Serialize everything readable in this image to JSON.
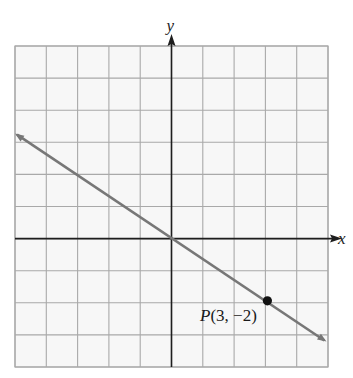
{
  "chart_data": {
    "type": "line",
    "title": "",
    "xlabel": "x",
    "ylabel": "y",
    "xlim": [
      -5,
      5
    ],
    "ylim": [
      -4,
      6
    ],
    "grid": true,
    "grid_step": 1,
    "legend": null,
    "series": [
      {
        "name": "line through origin and P",
        "equation": "y = -2/3 x",
        "slope": -0.6667,
        "intercept": 0,
        "x": [
          -5,
          0,
          3,
          5
        ],
        "y": [
          3.33,
          0,
          -2,
          -3.33
        ],
        "arrows": "both"
      }
    ],
    "points": [
      {
        "name": "P",
        "x": 3,
        "y": -2,
        "label": "P(3, −2)"
      }
    ],
    "annotations": [
      "P(3, −2)"
    ]
  },
  "labels": {
    "x_axis": "x",
    "y_axis": "y",
    "point_name": "P",
    "point_coords": "(3, −2)"
  },
  "colors": {
    "background": "#ffffff",
    "grid": "#a9a9a9",
    "axes": "#1e1e1e",
    "line": "#777777",
    "point": "#111111"
  }
}
